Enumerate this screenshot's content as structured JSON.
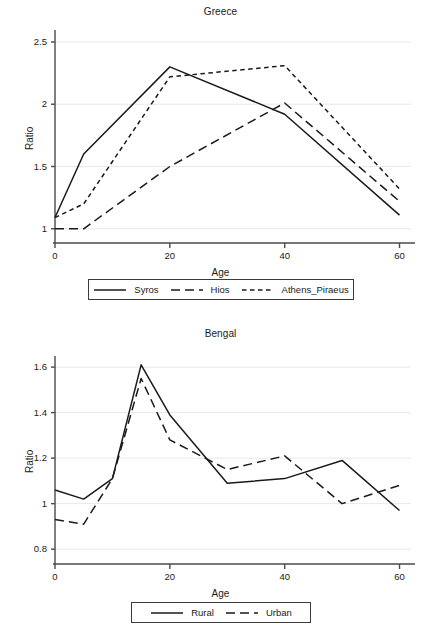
{
  "chart_data": [
    {
      "type": "line",
      "title": "Greece",
      "xlabel": "Age",
      "ylabel": "Ratio",
      "x": [
        0,
        5,
        20,
        40,
        60
      ],
      "xlim": [
        0,
        62
      ],
      "ylim": [
        0.95,
        2.58
      ],
      "xticks": [
        0,
        20,
        40,
        60
      ],
      "xticklabels": [
        "0",
        "20",
        "40",
        "60"
      ],
      "yticks": [
        1,
        1.5,
        2,
        2.5
      ],
      "yticklabels": [
        "1",
        "1.5",
        "2",
        "2.5"
      ],
      "grid": "horizontal",
      "legend_position": "below",
      "series": [
        {
          "name": "Syros",
          "style": "solid",
          "values": [
            1.09,
            1.6,
            2.3,
            1.92,
            1.11
          ]
        },
        {
          "name": "Hios",
          "style": "long-dash",
          "values": [
            1.0,
            1.0,
            1.5,
            2.01,
            1.22
          ]
        },
        {
          "name": "Athens_Piraeus",
          "style": "short-dash",
          "values": [
            1.09,
            1.2,
            2.22,
            2.31,
            1.32
          ]
        }
      ]
    },
    {
      "type": "line",
      "title": "Bengal",
      "xlabel": "Age",
      "ylabel": "Ratio",
      "x": [
        0,
        5,
        10,
        15,
        20,
        30,
        40,
        50,
        60
      ],
      "xlim": [
        0,
        62
      ],
      "ylim": [
        0.77,
        1.64
      ],
      "xticks": [
        0,
        20,
        40,
        60
      ],
      "xticklabels": [
        "0",
        "20",
        "40",
        "60"
      ],
      "yticks": [
        0.8,
        1.0,
        1.2,
        1.4,
        1.6
      ],
      "yticklabels": [
        "0.8",
        "1",
        "1.2",
        "1.4",
        "1.6"
      ],
      "grid": "horizontal",
      "legend_position": "below",
      "series": [
        {
          "name": "Rural",
          "style": "solid",
          "values": [
            1.06,
            1.02,
            1.11,
            1.61,
            1.39,
            1.09,
            1.11,
            1.19,
            0.97
          ]
        },
        {
          "name": "Urban",
          "style": "long-dash",
          "values": [
            0.93,
            0.91,
            1.11,
            1.55,
            1.28,
            1.15,
            1.21,
            1.0,
            1.08
          ]
        }
      ]
    }
  ],
  "style": {
    "line_color": "#1a1a1a",
    "axis_color": "#4a4a4a",
    "grid_color": "#e8e8e8",
    "background": "#ffffff"
  }
}
